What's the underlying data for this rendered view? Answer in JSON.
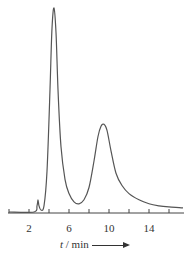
{
  "chart_data": {
    "type": "line",
    "title": "",
    "xlabel": "t / min",
    "ylabel": "",
    "xlim": [
      0,
      17.5
    ],
    "grid": false,
    "legend": null,
    "x_ticks": [
      0,
      2,
      4,
      6,
      8,
      10,
      12,
      14,
      16
    ],
    "x_tick_labels": [
      {
        "value": 2,
        "label": "2"
      },
      {
        "value": 6,
        "label": "6"
      },
      {
        "value": 10,
        "label": "10"
      },
      {
        "value": 14,
        "label": "14"
      }
    ],
    "series": [
      {
        "name": "chromatogram",
        "peaks": [
          {
            "t": 2.9,
            "relative_height": 0.06,
            "label": "minor peak"
          },
          {
            "t": 4.5,
            "relative_height": 1.0,
            "label": "major peak"
          },
          {
            "t": 9.5,
            "relative_height": 0.43,
            "label": "second peak"
          }
        ],
        "x": [
          0,
          2.5,
          2.8,
          2.9,
          3.0,
          3.2,
          3.5,
          3.8,
          4.1,
          4.3,
          4.5,
          4.7,
          4.9,
          5.2,
          5.6,
          6.0,
          6.5,
          7.0,
          7.5,
          8.0,
          8.5,
          8.9,
          9.2,
          9.5,
          9.8,
          10.2,
          10.7,
          11.3,
          12.0,
          13.0,
          14.0,
          15.0,
          16.0,
          17.4
        ],
        "y": [
          0,
          0.0,
          0.03,
          0.06,
          0.03,
          0.01,
          0.03,
          0.2,
          0.6,
          0.9,
          1.0,
          0.88,
          0.6,
          0.32,
          0.16,
          0.09,
          0.05,
          0.04,
          0.06,
          0.12,
          0.25,
          0.37,
          0.42,
          0.43,
          0.4,
          0.3,
          0.19,
          0.13,
          0.09,
          0.06,
          0.04,
          0.03,
          0.025,
          0.02
        ]
      }
    ]
  },
  "axis": {
    "xlabel_var": "t",
    "xlabel_unit": " / min"
  }
}
